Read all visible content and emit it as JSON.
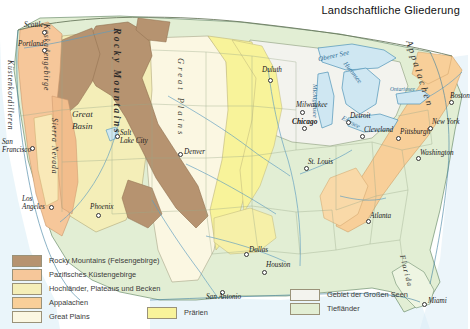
{
  "title": "Landschaftliche Gliederung",
  "legend": {
    "left_items": [
      {
        "label": "Rocky Mountains (Felsengebirge)",
        "color": "#b69370"
      },
      {
        "label": "Pazifisches Küstengebirge",
        "color": "#f6c79a"
      },
      {
        "label": "Hochländer, Plateaus und Becken",
        "color": "#f4eeb8"
      },
      {
        "label": "Appalachen",
        "color": "#f8cf99"
      },
      {
        "label": "Great Plains",
        "color": "#fbf7e2"
      }
    ],
    "mid_items": [
      {
        "label": "Prärien",
        "color": "#f8f39a"
      }
    ],
    "right_items": [
      {
        "label": "Gebiet der Großen Seen",
        "color": "#f3f3ee"
      },
      {
        "label": "Tiefländer",
        "color": "#e2eed4"
      }
    ]
  },
  "colors": {
    "rocky": "#b69370",
    "pacific_ranges": "#f6c79a",
    "highlands": "#f4eeb8",
    "appalachians": "#f8cf99",
    "great_plains": "#fbf7e2",
    "prairies": "#f8f39a",
    "great_lakes_region": "#f3f3ee",
    "lowlands": "#e2eed4",
    "water": "#cfe7f2",
    "water_line": "#4f94b8",
    "border": "#8a9a7a",
    "coast": "#3d7fa0"
  },
  "map": {
    "cities": [
      {
        "name": "Seattle",
        "x": 30,
        "y": 27,
        "dx": -2,
        "dy": 7,
        "bold": false
      },
      {
        "name": "Portland",
        "x": 22,
        "y": 46,
        "dx": -4,
        "dy": 7,
        "bold": false
      },
      {
        "name": "San\nFrancisco",
        "x": 8,
        "y": 145,
        "dx": 0,
        "dy": 0,
        "bold": false
      },
      {
        "name": "Los\nAngeles",
        "x": 19,
        "y": 198,
        "dx": 0,
        "dy": 0,
        "bold": false
      },
      {
        "name": "Phoenix",
        "x": 93,
        "y": 204,
        "dx": 0,
        "dy": 0,
        "bold": false
      },
      {
        "name": "Salt\nLake City",
        "x": 120,
        "y": 130,
        "dx": 0,
        "dy": 0,
        "bold": false
      },
      {
        "name": "Denver",
        "x": 185,
        "y": 150,
        "dx": 0,
        "dy": 0,
        "bold": false
      },
      {
        "name": "Duluth",
        "x": 264,
        "y": 69,
        "dx": 0,
        "dy": 0,
        "bold": false
      },
      {
        "name": "Milwaukee",
        "x": 298,
        "y": 105,
        "dx": 0,
        "dy": 0,
        "bold": false
      },
      {
        "name": "Chicago",
        "x": 296,
        "y": 122,
        "dx": 0,
        "dy": 0,
        "bold": true
      },
      {
        "name": "Detroit",
        "x": 348,
        "y": 116,
        "dx": 0,
        "dy": 0,
        "bold": false
      },
      {
        "name": "Cleveland",
        "x": 362,
        "y": 130,
        "dx": 0,
        "dy": 0,
        "bold": false
      },
      {
        "name": "Pittsburgh",
        "x": 400,
        "y": 132,
        "dx": 0,
        "dy": 0,
        "bold": false
      },
      {
        "name": "New York",
        "x": 432,
        "y": 122,
        "dx": 0,
        "dy": 0,
        "bold": false
      },
      {
        "name": "Washington",
        "x": 420,
        "y": 153,
        "dx": 0,
        "dy": 0,
        "bold": false
      },
      {
        "name": "Boston",
        "x": 451,
        "y": 96,
        "dx": 0,
        "dy": 0,
        "bold": false
      },
      {
        "name": "St. Louis",
        "x": 308,
        "y": 162,
        "dx": 0,
        "dy": 0,
        "bold": false
      },
      {
        "name": "Atlanta",
        "x": 370,
        "y": 216,
        "dx": 0,
        "dy": 0,
        "bold": false
      },
      {
        "name": "Dallas",
        "x": 248,
        "y": 249,
        "dx": 0,
        "dy": 0,
        "bold": false
      },
      {
        "name": "Houston",
        "x": 265,
        "y": 265,
        "dx": 0,
        "dy": 0,
        "bold": false
      },
      {
        "name": "San Antonio",
        "x": 211,
        "y": 293,
        "dx": 0,
        "dy": 0,
        "bold": false
      },
      {
        "name": "Miami",
        "x": 428,
        "y": 300,
        "dx": 0,
        "dy": 0,
        "bold": false
      }
    ],
    "water_labels": [
      {
        "name": "Oberer See",
        "x": 347,
        "y": 60
      },
      {
        "name": "Michigansee",
        "x": 330,
        "y": 92
      },
      {
        "name": "Huronsee",
        "x": 362,
        "y": 74
      },
      {
        "name": "Eriesee",
        "x": 365,
        "y": 122
      },
      {
        "name": "Ontariosee",
        "x": 398,
        "y": 94
      }
    ],
    "region_labels": [
      {
        "name": "Rocky Mountains",
        "x": 135,
        "y": 110
      },
      {
        "name": "Great Plains",
        "x": 195,
        "y": 120
      },
      {
        "name": "Great\nBasin",
        "x": 93,
        "y": 118
      },
      {
        "name": "Appalachen",
        "x": 420,
        "y": 110
      },
      {
        "name": "Küstenkordilleren",
        "x": 12,
        "y": 105
      },
      {
        "name": "Kaskadengebirge",
        "x": 48,
        "y": 55
      },
      {
        "name": "Sierra Nevada",
        "x": 58,
        "y": 150
      },
      {
        "name": "Florida",
        "x": 405,
        "y": 275
      }
    ]
  }
}
